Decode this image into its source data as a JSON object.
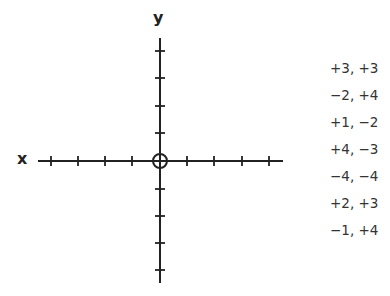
{
  "diagram": {
    "type": "coordinate-plane",
    "axes": {
      "x_label": "x",
      "y_label": "y",
      "x_range": [
        -4,
        4
      ],
      "y_range": [
        -4,
        4
      ],
      "tick_spacing": 1,
      "origin_marker": "circle"
    },
    "coordinate_pairs": [
      "+3, +3",
      "−2, +4",
      "+1, −2",
      "+4, −3",
      "−4, −4",
      "+2, +3",
      "−1, +4"
    ],
    "colors": {
      "axis": "#222222",
      "text": "#333333",
      "background": "#ffffff"
    }
  }
}
